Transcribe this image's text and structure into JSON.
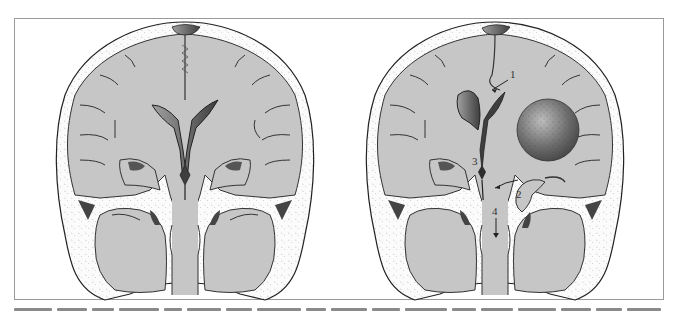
{
  "figure": {
    "panels": [
      {
        "id": "normal",
        "description": "Coronal section of normal brain",
        "labels": []
      },
      {
        "id": "herniation",
        "description": "Coronal section with space-occupying mass causing herniations",
        "labels": [
          {
            "text": "1",
            "meaning": "subfalcine herniation arrow"
          },
          {
            "text": "2",
            "meaning": "uncal (transtentorial) herniation"
          },
          {
            "text": "3",
            "meaning": "compressed midbrain / contralateral peduncle"
          },
          {
            "text": "4",
            "meaning": "downward (tonsillar) displacement arrow"
          }
        ]
      }
    ],
    "colors": {
      "brain": "#c8c8c8",
      "brain_edge": "#b0b0b0",
      "ventricle_dark": "#4a4a4a",
      "ventricle_light": "#8c8c8c",
      "skull": "#fafafa",
      "outline": "#222222",
      "mass": "#6e6e6e",
      "frame": "#9a9a9a"
    }
  },
  "caption": {
    "visible": "truncated"
  }
}
